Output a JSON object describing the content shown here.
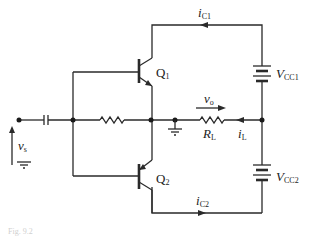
{
  "diagram": {
    "type": "circuit-schematic",
    "components": {
      "transistors": [
        {
          "id": "Q1",
          "label": "Q",
          "sub": "1",
          "type": "NPN"
        },
        {
          "id": "Q2",
          "label": "Q",
          "sub": "2",
          "type": "PNP"
        }
      ],
      "supplies": [
        {
          "id": "VCC1",
          "label": "V",
          "sub": "CC1"
        },
        {
          "id": "VCC2",
          "label": "V",
          "sub": "CC2"
        }
      ],
      "load": {
        "label": "R",
        "sub": "L"
      },
      "source": {
        "label": "v",
        "sub": "s"
      },
      "bias_resistor": {
        "label": ""
      },
      "coupling_capacitor": {
        "label": ""
      }
    },
    "currents": {
      "ic1": {
        "label": "i",
        "sub": "C1",
        "direction": "left"
      },
      "ic2": {
        "label": "i",
        "sub": "C2",
        "direction": "right"
      },
      "il": {
        "label": "i",
        "sub": "L",
        "direction": "left"
      }
    },
    "voltages": {
      "vo": {
        "label": "v",
        "sub": "o",
        "direction": "right"
      }
    },
    "caption": "Fig. 9.2"
  }
}
